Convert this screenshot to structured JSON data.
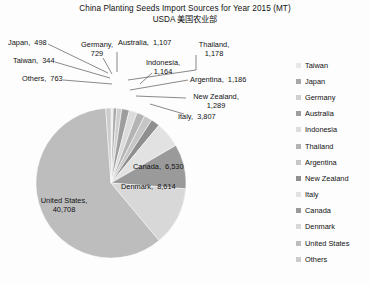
{
  "title": {
    "line1": "China Planting Seeds Import Sources for Year 2015 (MT)",
    "line2": "USDA  美国农业部"
  },
  "chart_data": {
    "type": "pie",
    "title": "China Planting Seeds Import Sources for Year 2015 (MT)",
    "subtitle": "USDA  美国农业部",
    "unit": "MT",
    "year": "2015",
    "legend_position": "right",
    "grid": false,
    "categories": [
      "Taiwan",
      "Japan",
      "Germany",
      "Australia",
      "Indonesia",
      "Thailand",
      "Argentina",
      "New Zealand",
      "Italy",
      "Canada",
      "Denmark",
      "United States",
      "Others"
    ],
    "values": [
      344,
      498,
      729,
      1107,
      1164,
      1178,
      1186,
      1289,
      3807,
      6530,
      8614,
      40708,
      763
    ],
    "colors": [
      "#e8e8e8",
      "#a8a8a8",
      "#cfcfcf",
      "#9d9d9d",
      "#dcdcdc",
      "#b4b4b4",
      "#c6c6c6",
      "#8f8f8f",
      "#e2e2e2",
      "#9a9a9a",
      "#d8d8d8",
      "#bdbdbd",
      "#cccccc"
    ],
    "slices": [
      {
        "name": "Taiwan",
        "value": 344,
        "label": "Taiwan,  344",
        "color": "#e8e8e8"
      },
      {
        "name": "Japan",
        "value": 498,
        "label": "Japan,  498",
        "color": "#a8a8a8"
      },
      {
        "name": "Germany",
        "value": 729,
        "label": "Germany,\n729",
        "color": "#cfcfcf"
      },
      {
        "name": "Australia",
        "value": 1107,
        "label": "Australia,  1,107",
        "color": "#9d9d9d"
      },
      {
        "name": "Indonesia",
        "value": 1164,
        "label": "Indonesia,\n1,164",
        "color": "#dcdcdc"
      },
      {
        "name": "Thailand",
        "value": 1178,
        "label": "Thailand,\n1,178",
        "color": "#b4b4b4"
      },
      {
        "name": "Argentina",
        "value": 1186,
        "label": "Argentina,  1,186",
        "color": "#c6c6c6"
      },
      {
        "name": "New Zealand",
        "value": 1289,
        "label": "New Zealand,\n1,289",
        "color": "#8f8f8f"
      },
      {
        "name": "Italy",
        "value": 3807,
        "label": "Italy,  3,807",
        "color": "#e2e2e2"
      },
      {
        "name": "Canada",
        "value": 6530,
        "label": "Canada,  6,530",
        "color": "#9a9a9a"
      },
      {
        "name": "Denmark",
        "value": 8614,
        "label": "Denmark,  8,614",
        "color": "#d8d8d8"
      },
      {
        "name": "United States",
        "value": 40708,
        "label": "United States,\n40,708",
        "color": "#bdbdbd"
      },
      {
        "name": "Others",
        "value": 763,
        "label": "Others,  763",
        "color": "#cccccc"
      }
    ],
    "total": 68917
  },
  "labels": {
    "japan": "Japan,  498",
    "taiwan": "Taiwan,  344",
    "others": "Others,  763",
    "germany": "Germany,\n729",
    "australia": "Australia,  1,107",
    "indonesia": "Indonesia,\n1,164",
    "thailand": "Thailand,\n1,178",
    "argentina": "Argentina,  1,186",
    "new_zealand": "New Zealand,\n1,289",
    "italy": "Italy,  3,807",
    "canada": "Canada,  6,530",
    "denmark": "Denmark,  8,614",
    "united_states": "United States,\n40,708"
  },
  "legend": {
    "items": [
      {
        "label": "Taiwan",
        "color": "#e8e8e8"
      },
      {
        "label": "Japan",
        "color": "#a8a8a8"
      },
      {
        "label": "Germany",
        "color": "#cfcfcf"
      },
      {
        "label": "Australia",
        "color": "#9d9d9d"
      },
      {
        "label": "Indonesia",
        "color": "#dcdcdc"
      },
      {
        "label": "Thailand",
        "color": "#b4b4b4"
      },
      {
        "label": "Argentina",
        "color": "#c6c6c6"
      },
      {
        "label": "New Zealand",
        "color": "#8f8f8f"
      },
      {
        "label": "Italy",
        "color": "#e2e2e2"
      },
      {
        "label": "Canada",
        "color": "#9a9a9a"
      },
      {
        "label": "Denmark",
        "color": "#d8d8d8"
      },
      {
        "label": "United States",
        "color": "#bdbdbd"
      },
      {
        "label": "Others",
        "color": "#cccccc"
      }
    ]
  }
}
